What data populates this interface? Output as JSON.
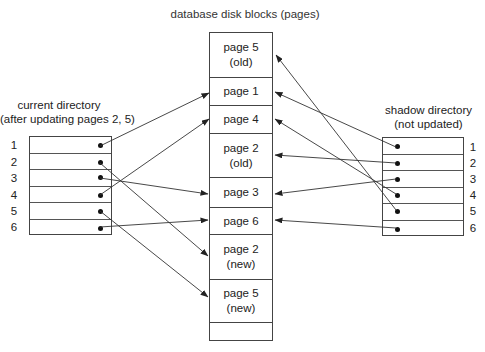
{
  "title": "database disk blocks (pages)",
  "current_directory": {
    "label_line1": "current directory",
    "label_line2": "(after updating pages 2, 5)",
    "entries": [
      {
        "num": "1",
        "points_to": "page 1"
      },
      {
        "num": "2",
        "points_to": "page 2 (new)"
      },
      {
        "num": "3",
        "points_to": "page 3"
      },
      {
        "num": "4",
        "points_to": "page 4"
      },
      {
        "num": "5",
        "points_to": "page 5 (new)"
      },
      {
        "num": "6",
        "points_to": "page 6"
      }
    ]
  },
  "shadow_directory": {
    "label_line1": "shadow directory",
    "label_line2": "(not updated)",
    "entries": [
      {
        "num": "1",
        "points_to": "page 1"
      },
      {
        "num": "2",
        "points_to": "page 2 (old)"
      },
      {
        "num": "3",
        "points_to": "page 3"
      },
      {
        "num": "4",
        "points_to": "page 4"
      },
      {
        "num": "5",
        "points_to": "page 5 (old)"
      },
      {
        "num": "6",
        "points_to": "page 6"
      }
    ]
  },
  "blocks": [
    {
      "line1": "page 5",
      "line2": "(old)"
    },
    {
      "line1": "page 1",
      "line2": ""
    },
    {
      "line1": "page 4",
      "line2": ""
    },
    {
      "line1": "page 2",
      "line2": "(old)"
    },
    {
      "line1": "page 3",
      "line2": ""
    },
    {
      "line1": "page 6",
      "line2": ""
    },
    {
      "line1": "page 2",
      "line2": "(new)"
    },
    {
      "line1": "page 5",
      "line2": "(new)"
    },
    {
      "line1": "",
      "line2": ""
    }
  ],
  "colors": {
    "line": "#333333",
    "background": "#ffffff"
  }
}
